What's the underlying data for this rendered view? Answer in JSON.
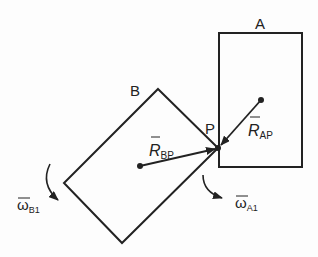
{
  "labels": {
    "body_a": "A",
    "body_b": "B",
    "point_p": "P",
    "r_ap": {
      "main": "R",
      "sub": "AP"
    },
    "r_bp": {
      "main": "R",
      "sub": "BP"
    },
    "omega_b1": {
      "main": "ω",
      "sub": "B1"
    },
    "omega_a1": {
      "main": "ω",
      "sub": "A1"
    }
  },
  "colors": {
    "stroke": "#222222",
    "background": "#fdfdfd"
  }
}
